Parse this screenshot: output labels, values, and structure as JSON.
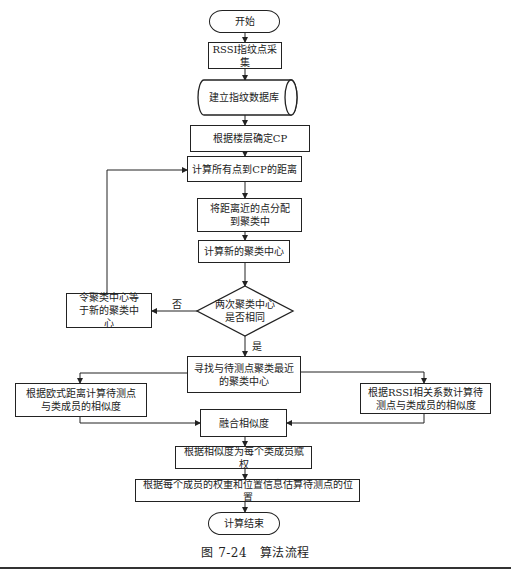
{
  "flowchart": {
    "start": "开始",
    "collect": "RSSI指纹点采集",
    "database": "建立指纹数据库",
    "determine_cp": "根据楼层确定CP",
    "calc_distance": "计算所有点到CP的距离",
    "assign_points": "将距离近的点分配到聚类中",
    "new_center": "计算新的聚类中心",
    "decision": "两次聚类中心是否相同",
    "set_center": "令聚类中心等于新的聚类中心",
    "no_label": "否",
    "yes_label": "是",
    "find_nearest": "寻找与待测点聚类最近的聚类中心",
    "euclid_similarity": "根据欧式距离计算待测点与类成员的相似度",
    "rssi_similarity": "根据RSSI相关系数计算待测点与类成员的相似度",
    "merge": "融合相似度",
    "weights": "根据相似度为每个类成员赋权",
    "estimate": "根据每个成员的权重和位置信息估算待测点的位置",
    "end": "计算结束"
  },
  "caption": "图 7-24　算法流程"
}
